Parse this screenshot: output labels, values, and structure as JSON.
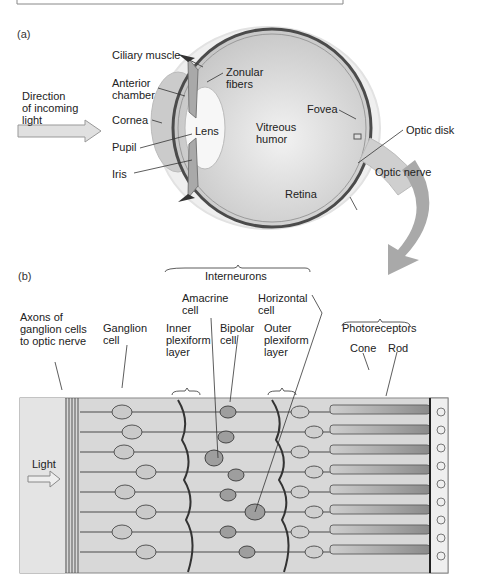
{
  "figure": {
    "panel_a": {
      "tag": "(a)",
      "direction_label": "Direction\nof incoming\nlight",
      "labels": {
        "ciliary_muscle": "Ciliary muscle",
        "anterior_chamber": "Anterior\nchamber",
        "cornea": "Cornea",
        "pupil": "Pupil",
        "iris": "Iris",
        "zonular_fibers": "Zonular\nfibers",
        "lens": "Lens",
        "vitreous_humor": "Vitreous\nhumor",
        "fovea": "Fovea",
        "optic_disk": "Optic disk",
        "optic_nerve": "Optic nerve",
        "retina": "Retina"
      }
    },
    "panel_b": {
      "tag": "(b)",
      "interneurons": "Interneurons",
      "amacrine_cell": "Amacrine\ncell",
      "horizontal_cell": "Horizontal\ncell",
      "axons": "Axons of\nganglion cells\nto optic nerve",
      "ganglion_cell": "Ganglion\ncell",
      "inner_plexiform": "Inner\nplexiform\nlayer",
      "bipolar_cell": "Bipolar\ncell",
      "outer_plexiform": "Outer\nplexiform\nlayer",
      "photoreceptors": "Photoreceptors",
      "cone": "Cone",
      "rod": "Rod",
      "light": "Light"
    },
    "colors": {
      "eye_fill": "#d4d4d4",
      "lens_fill": "#f6f6f6",
      "retina_edge": "#555555",
      "arrow_gray": "#a9a9a9",
      "panel_bg": "#d9d9d9"
    }
  }
}
